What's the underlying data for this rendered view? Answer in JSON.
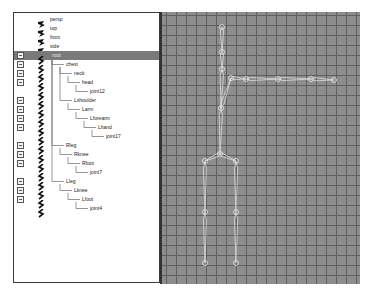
{
  "outliner": {
    "items": [
      {
        "label": "persp",
        "type": "camera",
        "depth": 0,
        "expandable": false,
        "selected": false
      },
      {
        "label": "top",
        "type": "camera",
        "depth": 0,
        "expandable": false,
        "selected": false
      },
      {
        "label": "front",
        "type": "camera",
        "depth": 0,
        "expandable": false,
        "selected": false
      },
      {
        "label": "side",
        "type": "camera",
        "depth": 0,
        "expandable": false,
        "selected": false
      },
      {
        "label": "root",
        "type": "joint",
        "depth": 0,
        "expandable": true,
        "selected": true
      },
      {
        "label": "chest",
        "type": "joint",
        "depth": 1,
        "expandable": true,
        "selected": false
      },
      {
        "label": "neck",
        "type": "joint",
        "depth": 2,
        "expandable": true,
        "selected": false
      },
      {
        "label": "head",
        "type": "joint",
        "depth": 3,
        "expandable": true,
        "selected": false
      },
      {
        "label": "joint12",
        "type": "joint",
        "depth": 4,
        "expandable": false,
        "selected": false
      },
      {
        "label": "Lshoulder",
        "type": "joint",
        "depth": 2,
        "expandable": true,
        "selected": false
      },
      {
        "label": "Larm",
        "type": "joint",
        "depth": 3,
        "expandable": true,
        "selected": false
      },
      {
        "label": "Lforearm",
        "type": "joint",
        "depth": 4,
        "expandable": true,
        "selected": false
      },
      {
        "label": "Lhand",
        "type": "joint",
        "depth": 5,
        "expandable": true,
        "selected": false
      },
      {
        "label": "joint17",
        "type": "joint",
        "depth": 6,
        "expandable": false,
        "selected": false
      },
      {
        "label": "Rleg",
        "type": "joint",
        "depth": 1,
        "expandable": true,
        "selected": false
      },
      {
        "label": "Rknee",
        "type": "joint",
        "depth": 2,
        "expandable": true,
        "selected": false
      },
      {
        "label": "Rfoot",
        "type": "joint",
        "depth": 3,
        "expandable": true,
        "selected": false
      },
      {
        "label": "joint7",
        "type": "joint",
        "depth": 4,
        "expandable": false,
        "selected": false
      },
      {
        "label": "Lleg",
        "type": "joint",
        "depth": 1,
        "expandable": true,
        "selected": false
      },
      {
        "label": "Lknee",
        "type": "joint",
        "depth": 2,
        "expandable": true,
        "selected": false
      },
      {
        "label": "Lfoot",
        "type": "joint",
        "depth": 3,
        "expandable": true,
        "selected": false
      },
      {
        "label": "joint4",
        "type": "joint",
        "depth": 4,
        "expandable": false,
        "selected": false
      }
    ]
  },
  "viewport": {
    "grid_color": "#5f5f5f",
    "background_color": "#8d8d8d",
    "bone_color": "#e6e6e6",
    "joints": [
      {
        "name": "joint12",
        "x": 60,
        "y": 15
      },
      {
        "name": "head",
        "x": 60,
        "y": 40
      },
      {
        "name": "neck",
        "x": 60,
        "y": 57
      },
      {
        "name": "Lshoulder",
        "x": 69,
        "y": 66
      },
      {
        "name": "Larm",
        "x": 84,
        "y": 67
      },
      {
        "name": "Lforearm",
        "x": 116,
        "y": 67
      },
      {
        "name": "Lhand",
        "x": 149,
        "y": 67
      },
      {
        "name": "joint17",
        "x": 172,
        "y": 68
      },
      {
        "name": "chest",
        "x": 59,
        "y": 96
      },
      {
        "name": "root",
        "x": 58,
        "y": 142
      },
      {
        "name": "Rleg",
        "x": 43,
        "y": 149
      },
      {
        "name": "Lleg",
        "x": 74,
        "y": 149
      },
      {
        "name": "Rknee",
        "x": 43,
        "y": 200
      },
      {
        "name": "Lknee",
        "x": 74,
        "y": 200
      },
      {
        "name": "joint7",
        "x": 43,
        "y": 251
      },
      {
        "name": "joint4",
        "x": 74,
        "y": 251
      }
    ],
    "bones": [
      [
        "joint12",
        "head"
      ],
      [
        "head",
        "neck"
      ],
      [
        "neck",
        "chest"
      ],
      [
        "Lshoulder",
        "Larm"
      ],
      [
        "Larm",
        "Lforearm"
      ],
      [
        "Lforearm",
        "Lhand"
      ],
      [
        "Lhand",
        "joint17"
      ],
      [
        "chest",
        "Lshoulder"
      ],
      [
        "chest",
        "root"
      ],
      [
        "root",
        "Rleg"
      ],
      [
        "root",
        "Lleg"
      ],
      [
        "Rleg",
        "Rknee"
      ],
      [
        "Rknee",
        "joint7"
      ],
      [
        "Lleg",
        "Lknee"
      ],
      [
        "Lknee",
        "joint4"
      ]
    ]
  }
}
